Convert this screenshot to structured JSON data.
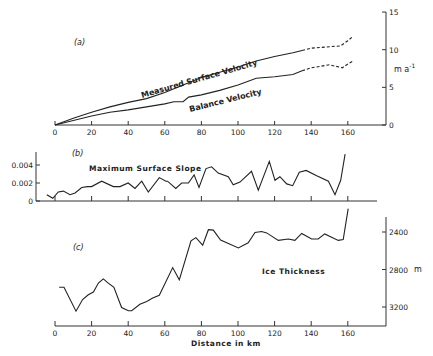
{
  "figure": {
    "xlabel": "Distance in km",
    "x_ticks": [
      "0",
      "20",
      "40",
      "60",
      "80",
      "100",
      "120",
      "140",
      "160"
    ]
  },
  "chart_data": [
    {
      "type": "line",
      "panel": "(a)",
      "title": "",
      "xlabel": "",
      "ylabel": "m a⁻¹",
      "xlim": [
        0,
        180
      ],
      "ylim": [
        0,
        15
      ],
      "y_ticks": [
        0,
        5,
        10,
        15
      ],
      "x_ticks": [
        0,
        20,
        40,
        60,
        80,
        100,
        120,
        140,
        160
      ],
      "grid": false,
      "annotations": [
        "(a)",
        "Measured Surface Velocity",
        "Balance Velocity"
      ],
      "series": [
        {
          "name": "Measured Surface Velocity",
          "x": [
            0,
            10,
            20,
            30,
            40,
            50,
            60,
            70,
            80,
            90,
            100,
            110,
            120,
            130,
            135
          ],
          "values": [
            0,
            0.9,
            1.7,
            2.4,
            3.0,
            3.5,
            4.3,
            5.3,
            6.3,
            7.0,
            7.7,
            8.5,
            9.1,
            9.6,
            9.9
          ],
          "style": "solid"
        },
        {
          "name": "Measured Surface Velocity (extrapolated)",
          "x": [
            135,
            140,
            150,
            156,
            160,
            163
          ],
          "values": [
            9.9,
            10.2,
            10.4,
            10.5,
            11.2,
            11.8
          ],
          "style": "dashed"
        },
        {
          "name": "Balance Velocity",
          "x": [
            0,
            10,
            20,
            30,
            40,
            50,
            60,
            65,
            70,
            73,
            80,
            90,
            100,
            110,
            120,
            130,
            135
          ],
          "values": [
            0,
            0.6,
            1.2,
            1.7,
            2.0,
            2.4,
            2.8,
            3.1,
            3.1,
            3.7,
            4.0,
            4.6,
            5.3,
            6.2,
            6.4,
            6.7,
            7.2
          ],
          "style": "solid"
        },
        {
          "name": "Balance Velocity (extrapolated)",
          "x": [
            135,
            140,
            150,
            157,
            160,
            163
          ],
          "values": [
            7.2,
            7.6,
            8.0,
            7.6,
            8.1,
            8.5
          ],
          "style": "dashed"
        }
      ]
    },
    {
      "type": "line",
      "panel": "(b)",
      "title": "",
      "xlabel": "",
      "ylabel": "",
      "xlim": [
        -10,
        180
      ],
      "ylim": [
        0,
        0.0054
      ],
      "y_ticks": [
        0,
        0.002,
        0.004
      ],
      "y_tick_labels": [
        "0",
        "0.002",
        "0.004"
      ],
      "x_ticks": [
        0,
        20,
        40,
        60,
        80,
        100,
        120,
        140,
        160
      ],
      "grid": false,
      "annotations": [
        "(b)",
        "Maximum Surface Slope"
      ],
      "series": [
        {
          "name": "Maximum Surface Slope",
          "x": [
            -4.5,
            -1.2,
            1.8,
            4.6,
            8.2,
            11,
            14.6,
            17.7,
            20,
            25.5,
            31.9,
            35.5,
            40,
            43.7,
            47.4,
            51,
            57,
            60.6,
            61.5,
            66,
            69.2,
            72.9,
            76,
            78.7,
            82.5,
            85.6,
            89.2,
            94.7,
            97.4,
            101.1,
            107.4,
            111.1,
            117.1,
            120.2,
            122.9,
            126.6,
            129.9,
            133.5,
            137.2,
            143,
            149.4,
            153,
            156.1,
            158.5
          ],
          "values": [
            0.0007,
            0.0003,
            0.001,
            0.0011,
            0.0007,
            0.0009,
            0.0015,
            0.0016,
            0.0016,
            0.0022,
            0.0016,
            0.0016,
            0.002,
            0.0014,
            0.0022,
            0.001,
            0.0026,
            0.0022,
            0.0022,
            0.0014,
            0.002,
            0.002,
            0.0029,
            0.0015,
            0.0036,
            0.0038,
            0.0031,
            0.0027,
            0.0018,
            0.0021,
            0.0033,
            0.0012,
            0.0044,
            0.0023,
            0.0027,
            0.0019,
            0.0017,
            0.0032,
            0.0034,
            0.0028,
            0.0022,
            0.0007,
            0.0023,
            0.0052
          ]
        }
      ]
    },
    {
      "type": "line",
      "panel": "(c)",
      "title": "",
      "xlabel": "Distance in km",
      "ylabel": "m",
      "xlim": [
        0,
        180
      ],
      "ylim_inverted": [
        3380,
        2210
      ],
      "y_ticks": [
        2400,
        2800,
        3200
      ],
      "x_ticks": [
        0,
        20,
        40,
        60,
        80,
        100,
        120,
        140,
        160
      ],
      "grid": false,
      "annotations": [
        "(c)",
        "Ice Thickness"
      ],
      "series": [
        {
          "name": "Ice Thickness",
          "x": [
            2.3,
            4.9,
            11.5,
            15.1,
            18.2,
            21,
            23.7,
            26.4,
            29.1,
            32.2,
            36.4,
            40.1,
            41.9,
            46.4,
            50.1,
            53.4,
            57,
            64.3,
            67.9,
            74.3,
            77,
            80.7,
            83.8,
            86.5,
            90.5,
            100.2,
            105.6,
            109.3,
            112.9,
            115.7,
            122,
            127.5,
            131.1,
            134.8,
            140.2,
            143.8,
            147.4,
            154.8,
            157.5,
            160.2
          ],
          "values": [
            2990,
            2990,
            3245,
            3120,
            3070,
            3040,
            2945,
            2900,
            2945,
            2990,
            3205,
            3240,
            3240,
            3170,
            3140,
            3105,
            3075,
            2780,
            2910,
            2495,
            2460,
            2540,
            2375,
            2380,
            2485,
            2570,
            2515,
            2405,
            2395,
            2410,
            2490,
            2475,
            2490,
            2415,
            2475,
            2475,
            2420,
            2490,
            2480,
            2150
          ]
        }
      ]
    }
  ],
  "labels": {
    "panel_a": "(a)",
    "panel_b": "(b)",
    "panel_c": "(c)",
    "measured": "Measured Surface Velocity",
    "balance": "Balance Velocity",
    "slope": "Maximum Surface Slope",
    "thickness": "Ice Thickness",
    "unit_a": "m a",
    "unit_a_sup": "-1",
    "unit_c": "m",
    "a_yticks": [
      "0",
      "5",
      "10",
      "15"
    ],
    "b_yticks": [
      "0",
      "0.002",
      "0.004"
    ],
    "c_yticks": [
      "2400",
      "2800",
      "3200"
    ]
  }
}
